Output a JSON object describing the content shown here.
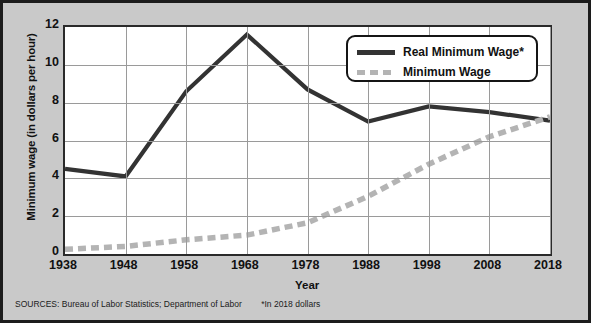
{
  "chart_data": {
    "type": "line",
    "title": "",
    "xlabel": "Year",
    "ylabel": "Minimum wage (in dollars per hour)",
    "x": [
      1938,
      1948,
      1958,
      1968,
      1978,
      1988,
      1998,
      2008,
      2018
    ],
    "xticks": [
      "1938",
      "1948",
      "1958",
      "1968",
      "1978",
      "1988",
      "1998",
      "2008",
      "2018"
    ],
    "yticks": [
      "0",
      "2",
      "4",
      "6",
      "8",
      "10",
      "12"
    ],
    "xlim": [
      1938,
      2018
    ],
    "ylim": [
      0,
      12
    ],
    "grid": true,
    "legend_position": "top-right",
    "series": [
      {
        "name": "Real Minimum Wage*",
        "style": "solid",
        "color": "#333333",
        "values": [
          4.5,
          4.1,
          8.6,
          11.6,
          8.7,
          7.0,
          7.8,
          7.5,
          7.05
        ]
      },
      {
        "name": "Minimum Wage",
        "style": "dashed",
        "color": "#b4b4b4",
        "values": [
          0.25,
          0.4,
          0.75,
          1.0,
          1.65,
          3.05,
          4.75,
          6.2,
          7.25
        ]
      }
    ]
  },
  "legend": {
    "items": [
      {
        "label": "Real Minimum Wage*"
      },
      {
        "label": "Minimum Wage"
      }
    ]
  },
  "footer": {
    "sources": "SOURCES: Bureau of Labor Statistics; Department of Labor",
    "footnote": "*In 2018 dollars"
  }
}
